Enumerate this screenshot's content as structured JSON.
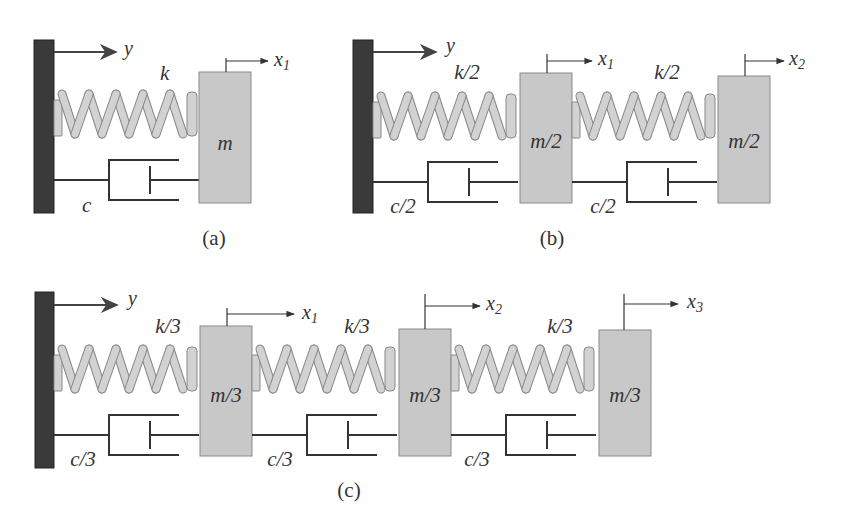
{
  "figure": {
    "colors": {
      "wall": "#3a3a3a",
      "mass_fill": "#c8c8c8",
      "mass_stroke": "#8a8a8a",
      "spring_fill": "#d2d2d2",
      "spring_stroke": "#888888",
      "line": "#333333"
    },
    "panels": [
      {
        "id": "a",
        "caption": "(a)",
        "input_label": "y",
        "springs": [
          {
            "label": "k"
          }
        ],
        "dampers": [
          {
            "label": "c"
          }
        ],
        "masses": [
          {
            "label": "m",
            "disp_label": "x",
            "disp_sub": "1"
          }
        ]
      },
      {
        "id": "b",
        "caption": "(b)",
        "input_label": "y",
        "springs": [
          {
            "label": "k/2"
          },
          {
            "label": "k/2"
          }
        ],
        "dampers": [
          {
            "label": "c/2"
          },
          {
            "label": "c/2"
          }
        ],
        "masses": [
          {
            "label": "m/2",
            "disp_label": "x",
            "disp_sub": "1"
          },
          {
            "label": "m/2",
            "disp_label": "x",
            "disp_sub": "2"
          }
        ]
      },
      {
        "id": "c",
        "caption": "(c)",
        "input_label": "y",
        "springs": [
          {
            "label": "k/3"
          },
          {
            "label": "k/3"
          },
          {
            "label": "k/3"
          }
        ],
        "dampers": [
          {
            "label": "c/3"
          },
          {
            "label": "c/3"
          },
          {
            "label": "c/3"
          }
        ],
        "masses": [
          {
            "label": "m/3",
            "disp_label": "x",
            "disp_sub": "1"
          },
          {
            "label": "m/3",
            "disp_label": "x",
            "disp_sub": "2"
          },
          {
            "label": "m/3",
            "disp_label": "x",
            "disp_sub": "3"
          }
        ]
      }
    ]
  }
}
